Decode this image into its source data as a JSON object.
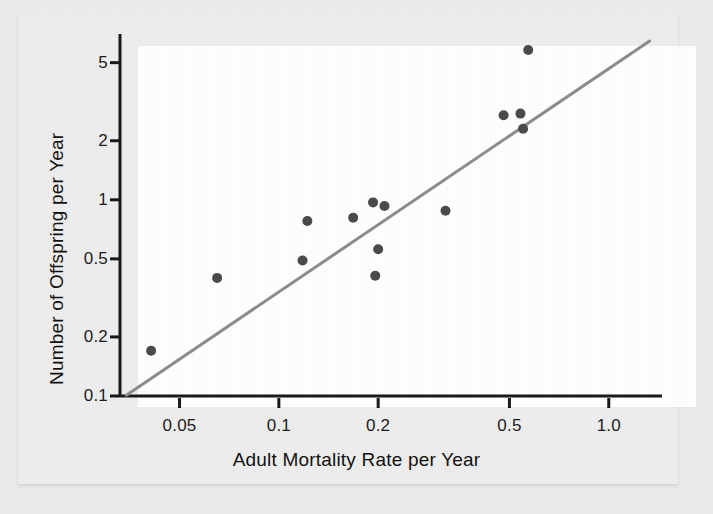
{
  "chart_data": {
    "type": "scatter",
    "title": "",
    "xlabel": "Adult Mortality Rate per Year",
    "ylabel": "Number of Offspring per Year",
    "xscale": "log",
    "yscale": "log",
    "xlim": [
      0.033,
      1.45
    ],
    "ylim": [
      0.1,
      7.0
    ],
    "grid": false,
    "legend": null,
    "xticks": [
      0.05,
      0.1,
      0.2,
      0.5,
      1.0
    ],
    "xtick_labels": [
      "0.05",
      "0.1",
      "0.2",
      "0.5",
      "1.0"
    ],
    "yticks": [
      0.1,
      0.2,
      0.5,
      1,
      2,
      5
    ],
    "ytick_labels": [
      "0.1",
      "0.2",
      "0.5",
      "1",
      "2",
      "5"
    ],
    "marker_color": "#4b4b4b",
    "marker_size_px": 10,
    "line_color": "#8d8d8d",
    "line_width_px": 3,
    "axis_color": "#1a1a1a",
    "panel_background": "#ffffff",
    "figure_background": "#efeeee",
    "series": [
      {
        "name": "Species",
        "type": "scatter",
        "points": [
          {
            "x": 0.041,
            "y": 0.17
          },
          {
            "x": 0.065,
            "y": 0.4
          },
          {
            "x": 0.118,
            "y": 0.49
          },
          {
            "x": 0.122,
            "y": 0.78
          },
          {
            "x": 0.168,
            "y": 0.81
          },
          {
            "x": 0.196,
            "y": 0.41
          },
          {
            "x": 0.193,
            "y": 0.97
          },
          {
            "x": 0.2,
            "y": 0.56
          },
          {
            "x": 0.209,
            "y": 0.93
          },
          {
            "x": 0.32,
            "y": 0.88
          },
          {
            "x": 0.48,
            "y": 2.7
          },
          {
            "x": 0.54,
            "y": 2.75
          },
          {
            "x": 0.55,
            "y": 2.3
          },
          {
            "x": 0.57,
            "y": 5.8
          }
        ]
      },
      {
        "name": "Trend line",
        "type": "line",
        "points": [
          {
            "x": 0.0345,
            "y": 0.101
          },
          {
            "x": 1.33,
            "y": 6.45
          }
        ]
      }
    ]
  },
  "axes": {
    "x_title": "Adult Mortality Rate per Year",
    "y_title": "Number of Offspring per Year"
  }
}
